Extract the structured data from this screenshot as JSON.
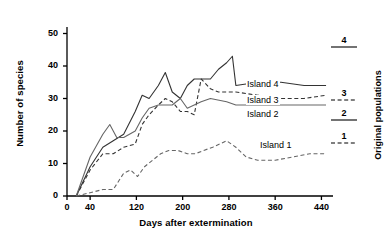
{
  "chart_data": {
    "type": "line",
    "title": "",
    "xlabel": "Days after extermination",
    "ylabel": "Number of species",
    "right_axis_label": "Original populations",
    "xlim": [
      0,
      460
    ],
    "ylim": [
      0,
      52
    ],
    "xticks": [
      0,
      40,
      120,
      200,
      280,
      360,
      440
    ],
    "yticks": [
      0,
      10,
      20,
      30,
      40,
      50
    ],
    "grid": false,
    "legend_position": "inline-right",
    "series": [
      {
        "name": "Island 4",
        "style": "solid",
        "color": "#333333",
        "original_population": 4,
        "x": [
          16,
          40,
          62,
          80,
          98,
          118,
          130,
          142,
          158,
          170,
          182,
          196,
          208,
          220,
          232,
          248,
          262,
          276,
          286,
          292,
          330,
          370,
          410,
          448
        ],
        "y": [
          0,
          9,
          15,
          17,
          19,
          26,
          31,
          30,
          34,
          38,
          32,
          30,
          34,
          36,
          36,
          36,
          39,
          41,
          43,
          34,
          35,
          35,
          34,
          34
        ]
      },
      {
        "name": "Island 3",
        "style": "dashed",
        "color": "#333333",
        "original_population": 3,
        "x": [
          16,
          40,
          62,
          80,
          98,
          118,
          130,
          142,
          158,
          170,
          182,
          196,
          208,
          220,
          232,
          248,
          262,
          276,
          292,
          330,
          370,
          410,
          448
        ],
        "y": [
          0,
          8,
          13,
          13,
          15,
          16,
          22,
          25,
          28,
          30,
          29,
          26,
          26,
          25,
          36,
          33,
          32,
          32,
          32,
          31,
          30,
          30,
          31
        ]
      },
      {
        "name": "Island 2",
        "style": "solid",
        "color": "#666666",
        "original_population": 2,
        "x": [
          16,
          40,
          62,
          74,
          86,
          98,
          118,
          130,
          142,
          158,
          170,
          182,
          196,
          208,
          220,
          232,
          248,
          276,
          292,
          330,
          370,
          410,
          448
        ],
        "y": [
          0,
          12,
          19,
          22,
          18,
          18,
          20,
          24,
          27,
          28,
          28,
          28,
          30,
          27,
          28,
          29,
          30,
          29,
          28,
          28,
          28,
          28,
          28
        ]
      },
      {
        "name": "Island 1",
        "style": "dashed",
        "color": "#666666",
        "original_population": 1,
        "x": [
          16,
          40,
          62,
          80,
          98,
          110,
          122,
          134,
          148,
          162,
          176,
          192,
          208,
          222,
          236,
          252,
          264,
          276,
          292,
          310,
          330,
          360,
          390,
          420,
          448
        ],
        "y": [
          0,
          1,
          2,
          2,
          7,
          8,
          6,
          9,
          11,
          13,
          14,
          14,
          13,
          13,
          14,
          15,
          16,
          17,
          15,
          12,
          11,
          11,
          12,
          13,
          13
        ]
      }
    ],
    "legend_entries": [
      {
        "label": "4",
        "style": "solid"
      },
      {
        "label": "3",
        "style": "dashed"
      },
      {
        "label": "2",
        "style": "solid"
      },
      {
        "label": "1",
        "style": "dashed"
      }
    ],
    "inline_labels": [
      "Island 4",
      "Island 3",
      "Island 2",
      "Island 1"
    ]
  }
}
